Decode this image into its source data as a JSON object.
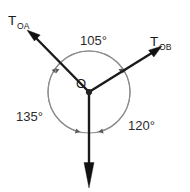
{
  "diagram": {
    "origin": {
      "label": "O",
      "x": 89,
      "y": 92
    },
    "circle": {
      "center_x": 89,
      "center_y": 92,
      "radius": 41,
      "stroke_color": "#8d8d8d"
    },
    "colors": {
      "ray": "#111111",
      "circle": "#8d8d8d",
      "arc": "#5a5a5a",
      "text": "#1a1a1a",
      "background": "#ffffff"
    },
    "vectors": [
      {
        "id": "toa",
        "label_base": "T",
        "label_sub": "OA",
        "angle_deg": 145,
        "tip_x": 27,
        "tip_y": 30,
        "label_x": 10,
        "label_y": 22
      },
      {
        "id": "tob",
        "label_base": "T",
        "label_sub": "OB",
        "angle_deg": 35,
        "tip_x": 162,
        "tip_y": 46,
        "label_x": 152,
        "label_y": 44
      },
      {
        "id": "tdown",
        "label_base": "",
        "label_sub": "",
        "angle_deg": 270,
        "tip_x": 89,
        "tip_y": 188,
        "label_x": 0,
        "label_y": 0
      }
    ],
    "angles": [
      {
        "id": "angle-top",
        "value": "105°",
        "between": "toa-tob",
        "start_deg": 35,
        "end_deg": 145,
        "label_x": 97,
        "label_y": 44
      },
      {
        "id": "angle-left",
        "value": "135°",
        "between": "toa-tdown",
        "start_deg": 145,
        "end_deg": 270,
        "label_x": 33,
        "label_y": 119
      },
      {
        "id": "angle-right",
        "value": "120°",
        "between": "tob-tdown",
        "start_deg": 270,
        "end_deg": 395,
        "label_x": 146,
        "label_y": 128
      }
    ]
  }
}
